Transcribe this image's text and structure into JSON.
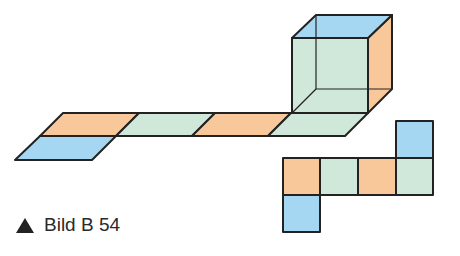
{
  "figure": {
    "caption_marker": "triangle-up",
    "caption": "Bild B 54",
    "colors": {
      "orange": "#f8c89a",
      "green": "#cfe8da",
      "blue": "#a6d7f2",
      "stroke": "#222222"
    },
    "cube": {
      "faces": {
        "top": "blue",
        "front": "green",
        "right": "orange"
      }
    },
    "oblique_strip": {
      "segments": [
        "orange",
        "green",
        "orange",
        "green"
      ],
      "attached_below_first": "blue"
    },
    "flat_net": {
      "row": [
        "orange",
        "green",
        "orange",
        "green"
      ],
      "above_col4": "blue",
      "below_col1": "blue"
    }
  }
}
